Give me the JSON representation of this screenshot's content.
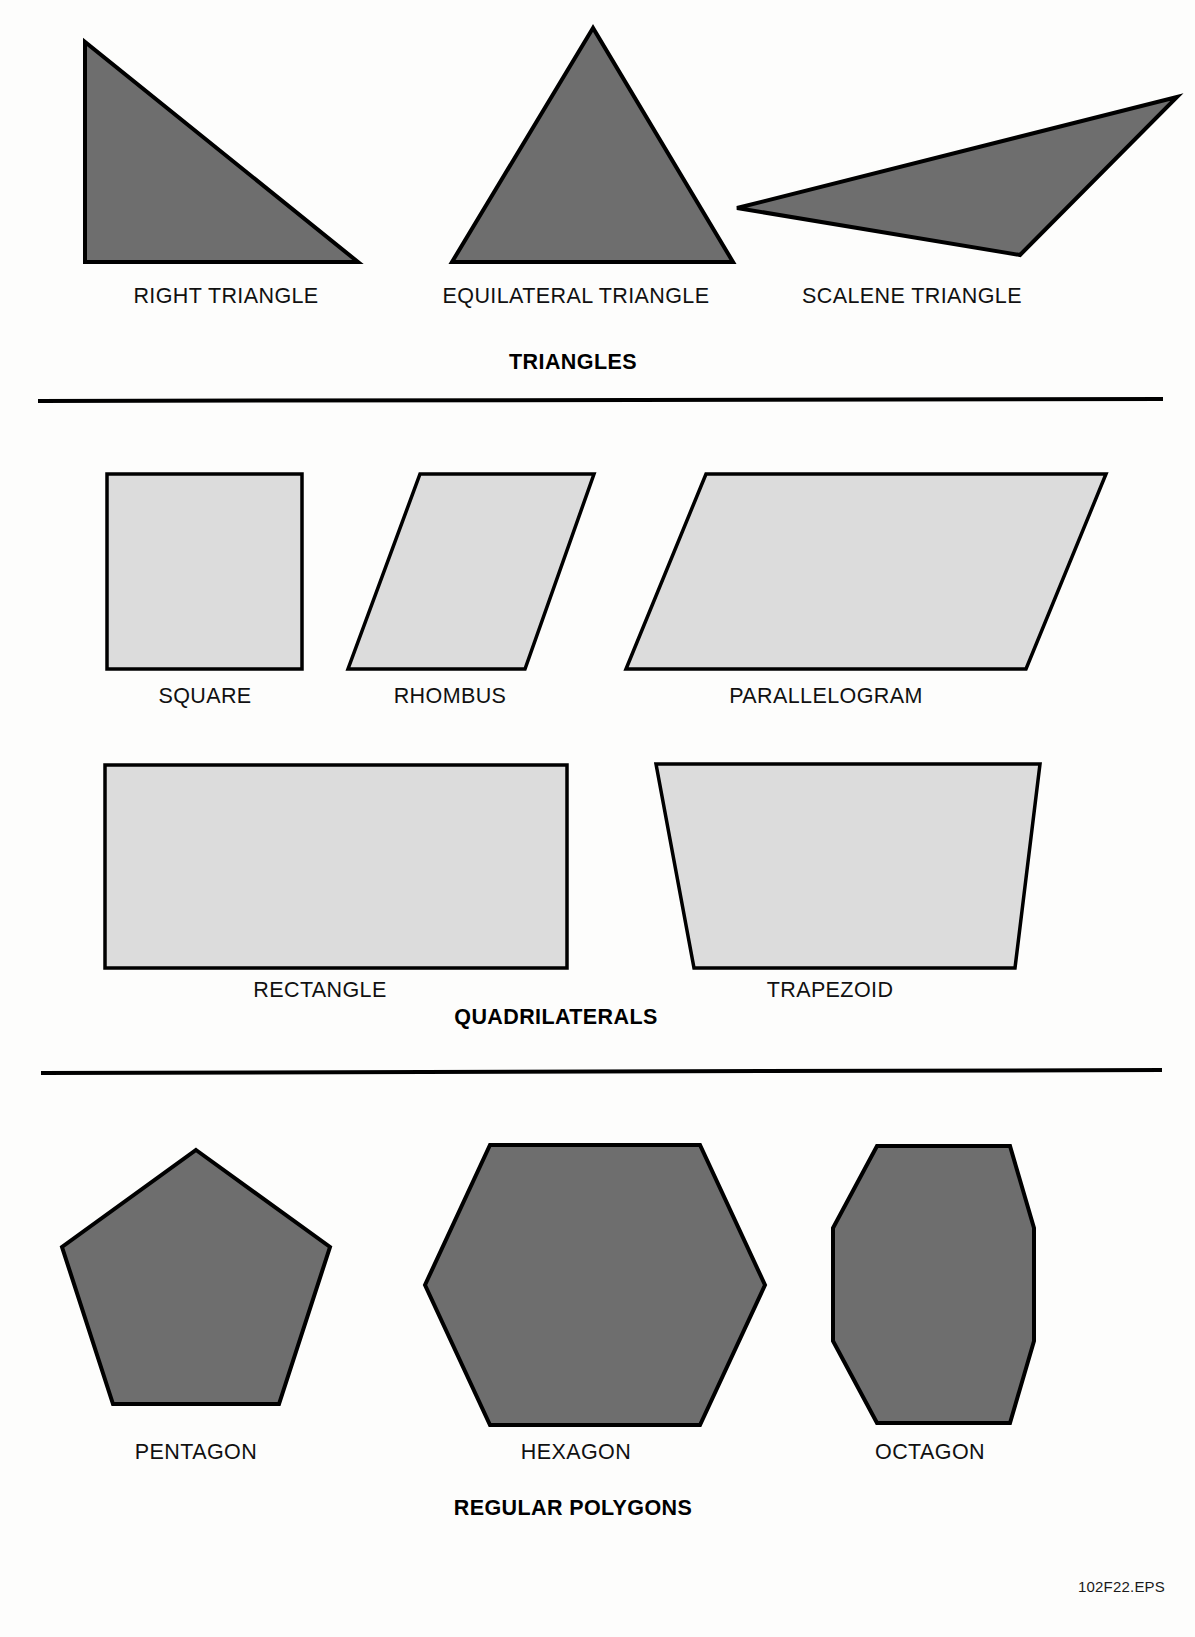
{
  "page": {
    "background_color": "#fdfdfc",
    "figure_code": "102F22.EPS",
    "dark_fill": "#6e6e6e",
    "light_fill": "#dcdcdc",
    "stroke_color": "#000000"
  },
  "sections": [
    {
      "id": "triangles",
      "heading": "TRIANGLES",
      "heading_x": 573,
      "heading_y": 350,
      "fill": "#6e6e6e",
      "shapes": [
        {
          "name": "right-triangle",
          "label": "RIGHT TRIANGLE",
          "label_x": 226,
          "label_y": 284,
          "points": "85,42 85,262 358,262",
          "fill": "#6e6e6e"
        },
        {
          "name": "equilateral-triangle",
          "label": "EQUILATERAL TRIANGLE",
          "label_x": 576,
          "label_y": 284,
          "points": "593,28 452,262 733,262",
          "fill": "#6e6e6e"
        },
        {
          "name": "scalene-triangle",
          "label": "SCALENE TRIANGLE",
          "label_x": 912,
          "label_y": 284,
          "points": "737,208 1177,97 1020,255",
          "fill": "#6e6e6e"
        }
      ]
    },
    {
      "id": "quadrilaterals",
      "heading": "QUADRILATERALS",
      "heading_x": 556,
      "heading_y": 1005,
      "fill": "#dcdcdc",
      "shapes": [
        {
          "name": "square",
          "label": "SQUARE",
          "label_x": 205,
          "label_y": 684,
          "points": "107,474 302,474 302,669 107,669",
          "fill": "#dcdcdc"
        },
        {
          "name": "rhombus",
          "label": "RHOMBUS",
          "label_x": 450,
          "label_y": 684,
          "points": "420,474 594,474 525,669 348,669",
          "fill": "#dcdcdc"
        },
        {
          "name": "parallelogram",
          "label": "PARALLELOGRAM",
          "label_x": 826,
          "label_y": 684,
          "points": "706,474 1106,474 1026,669 626,669",
          "fill": "#dcdcdc"
        },
        {
          "name": "rectangle",
          "label": "RECTANGLE",
          "label_x": 320,
          "label_y": 978,
          "points": "105,765 567,765 567,968 105,968",
          "fill": "#dcdcdc"
        },
        {
          "name": "trapezoid",
          "label": "TRAPEZOID",
          "label_x": 830,
          "label_y": 978,
          "points": "656,764 1040,764 1015,968 694,968",
          "fill": "#dcdcdc"
        }
      ]
    },
    {
      "id": "regular-polygons",
      "heading": "REGULAR POLYGONS",
      "heading_x": 573,
      "heading_y": 1496,
      "fill": "#6e6e6e",
      "shapes": [
        {
          "name": "pentagon",
          "label": "PENTAGON",
          "label_x": 196,
          "label_y": 1440,
          "points": "196,1150 330,1247 279,1404 113,1404 62,1247",
          "fill": "#6e6e6e"
        },
        {
          "name": "hexagon",
          "label": "HEXAGON",
          "label_x": 576,
          "label_y": 1440,
          "points": "490,1145 700,1145 765,1285 700,1425 490,1425 425,1285",
          "fill": "#6e6e6e"
        },
        {
          "name": "octagon",
          "label": "OCTAGON",
          "label_x": 930,
          "label_y": 1440,
          "points": "877,1146 1010,1146 1034,1228 1034,1341 1010,1423 877,1423 833,1341 833,1228",
          "fill": "#6e6e6e"
        }
      ]
    }
  ],
  "dividers": [
    {
      "name": "divider-triangles-quadrilaterals",
      "x1": 38,
      "y1": 401,
      "x2": 1163,
      "y2": 399
    },
    {
      "name": "divider-quadrilaterals-polygons",
      "x1": 41,
      "y1": 1073,
      "x2": 1162,
      "y2": 1070
    }
  ]
}
